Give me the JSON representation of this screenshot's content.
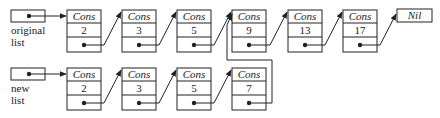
{
  "diagram": {
    "title": "",
    "colors": {
      "stroke": "#222222",
      "background": "#ffffff"
    },
    "heads": [
      {
        "id": "orig-head",
        "label_lines": [
          "original",
          "list"
        ],
        "x": 11,
        "y": 10,
        "points_to": "o2"
      },
      {
        "id": "new-head",
        "label_lines": [
          "new",
          "list"
        ],
        "x": 11,
        "y": 68,
        "points_to": "n2"
      }
    ],
    "cons_label": "Cons",
    "nil_label": "Nil",
    "original_list": [
      {
        "id": "o2",
        "tag": "Cons",
        "value": "2",
        "x": 67,
        "next": "o3"
      },
      {
        "id": "o3",
        "tag": "Cons",
        "value": "3",
        "x": 122,
        "next": "o5"
      },
      {
        "id": "o5",
        "tag": "Cons",
        "value": "5",
        "x": 177,
        "next": "o9"
      },
      {
        "id": "o9",
        "tag": "Cons",
        "value": "9",
        "x": 232,
        "next": "o13"
      },
      {
        "id": "o13",
        "tag": "Cons",
        "value": "13",
        "x": 288,
        "next": "o17"
      },
      {
        "id": "o17",
        "tag": "Cons",
        "value": "17",
        "x": 343,
        "next": "nil"
      }
    ],
    "nil_node": {
      "id": "nil",
      "tag": "Nil",
      "x": 397,
      "y": 9
    },
    "new_list": [
      {
        "id": "n2",
        "tag": "Cons",
        "value": "2",
        "x": 67,
        "next": "n3"
      },
      {
        "id": "n3",
        "tag": "Cons",
        "value": "3",
        "x": 122,
        "next": "n5"
      },
      {
        "id": "n5",
        "tag": "Cons",
        "value": "5",
        "x": 177,
        "next": "n7"
      },
      {
        "id": "n7",
        "tag": "Cons",
        "value": "7",
        "x": 232,
        "next": "o9"
      }
    ]
  }
}
